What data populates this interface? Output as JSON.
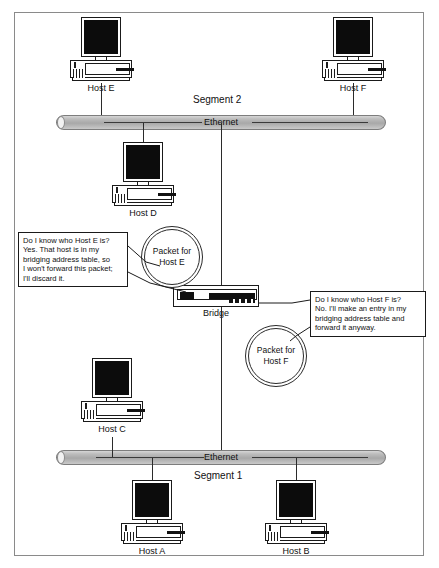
{
  "diagram": {
    "segments": [
      {
        "id": "segment2",
        "name": "Segment 2",
        "media_label": "Ethernet"
      },
      {
        "id": "segment1",
        "name": "Segment 1",
        "media_label": "Ethernet"
      }
    ],
    "hosts": [
      {
        "id": "host-e",
        "label": "Host E",
        "segment": "Segment 2"
      },
      {
        "id": "host-f",
        "label": "Host F",
        "segment": "Segment 2"
      },
      {
        "id": "host-d",
        "label": "Host D",
        "segment": "Segment 2"
      },
      {
        "id": "host-c",
        "label": "Host C",
        "segment": "Segment 1"
      },
      {
        "id": "host-a",
        "label": "Host A",
        "segment": "Segment 1"
      },
      {
        "id": "host-b",
        "label": "Host B",
        "segment": "Segment 1"
      }
    ],
    "device": {
      "id": "bridge",
      "label": "Bridge"
    },
    "packets": [
      {
        "id": "packet-host-e",
        "line1": "Packet for",
        "line2": "Host E"
      },
      {
        "id": "packet-host-f",
        "line1": "Packet for",
        "line2": "Host F"
      }
    ],
    "callouts": [
      {
        "id": "callout-host-e",
        "lines": [
          "Do I know who Host E is?",
          "Yes. That host is in my",
          "bridging address table, so",
          "I won't forward this packet;",
          "I'll discard it."
        ]
      },
      {
        "id": "callout-host-f",
        "lines": [
          "Do I know who Host F is?",
          "No. I'll make an entry in my",
          "bridging address table and",
          "forward it anyway."
        ]
      }
    ],
    "colors": {
      "frame_border": "#8a8a8a",
      "line": "#2b2b2b",
      "screen": "#0c0c0c",
      "bus_fill": "#b4b4b4",
      "background": "#ffffff"
    }
  }
}
